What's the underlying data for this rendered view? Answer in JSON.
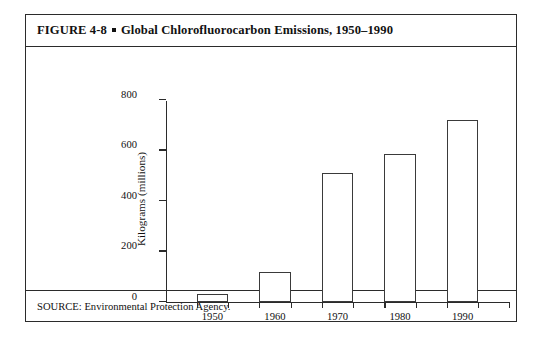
{
  "figure": {
    "label": "FIGURE 4-8",
    "separator": "square-bullet",
    "title": "Global Chlorofluorocarbon Emissions, 1950–1990",
    "source": "SOURCE: Environmental Protection Agency."
  },
  "chart_data": {
    "type": "bar",
    "title": "Global Chlorofluorocarbon Emissions, 1950–1990",
    "categories": [
      "1950",
      "1960",
      "1970",
      "1980",
      "1990"
    ],
    "values": [
      30,
      120,
      510,
      585,
      720
    ],
    "xlabel": "",
    "ylabel": "Kilograms (millions)",
    "ylim": [
      0,
      800
    ],
    "yticks": [
      0,
      200,
      400,
      600,
      800
    ],
    "ytick_labels": [
      "0",
      "200",
      "400",
      "600",
      "800"
    ],
    "grid": false,
    "legend": false,
    "bar_fill": "#ffffff",
    "bar_edge": "#3a3a3a",
    "axis_color": "#2b2b2b"
  }
}
